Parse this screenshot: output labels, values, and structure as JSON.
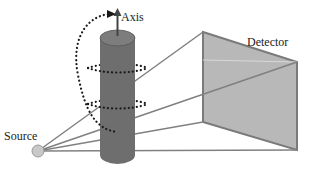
{
  "diagram": {
    "type": "ct-scan-geometry",
    "labels": {
      "axis": "Axis",
      "detector": "Detector",
      "source": "Source"
    },
    "colors": {
      "cylinder": "#6e6e6e",
      "cylinder_top": "#7d7d7d",
      "detector_fill": "#b8b8b8",
      "detector_stroke": "#7a7a7a",
      "rays": "#808080",
      "source_fill": "#c8c8c8",
      "orbit_dots": "#1a1a1a"
    },
    "components": [
      {
        "name": "Source",
        "shape": "circle"
      },
      {
        "name": "Object",
        "shape": "cylinder"
      },
      {
        "name": "Detector",
        "shape": "quadrilateral"
      },
      {
        "name": "Axis",
        "shape": "arrow"
      },
      {
        "name": "Rotation orbits",
        "shape": "dotted-ellipses"
      }
    ]
  }
}
